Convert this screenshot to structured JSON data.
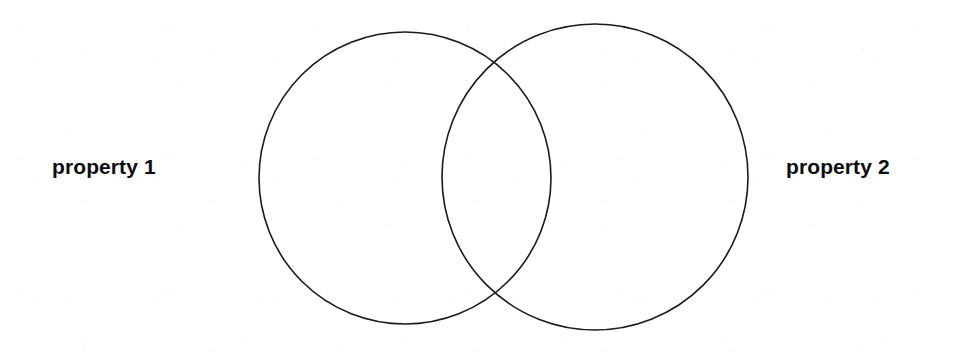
{
  "diagram": {
    "type": "venn-two-set",
    "title": "",
    "background_color": "#ffffff",
    "stroke_color": "#1a1a1a",
    "label_color": "#0d0d0d",
    "sets": [
      {
        "id": "set-left",
        "label": "property 1",
        "cx": 405,
        "cy": 178,
        "r": 146
      },
      {
        "id": "set-right",
        "label": "property 2",
        "cx": 595,
        "cy": 177,
        "r": 153
      }
    ],
    "intersection": {
      "label": "",
      "upper_point": "500, 50",
      "lower_point": "500, 300"
    }
  }
}
